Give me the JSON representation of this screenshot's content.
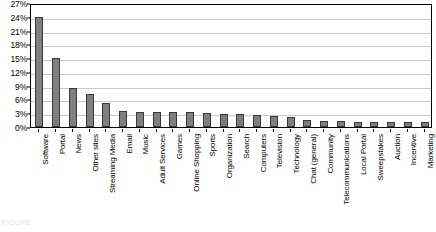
{
  "chart_data": {
    "type": "bar",
    "title": "",
    "xlabel": "",
    "ylabel": "",
    "ylim": [
      0,
      27
    ],
    "ytick_step": 3,
    "grid": true,
    "legend": null,
    "bar_color": "#7f7f7f",
    "bar_border_color": "#3a3a3a",
    "gridline_color": "#c9c9c9",
    "axis_color": "#000000",
    "ytick_labels": [
      "0%",
      "3%",
      "6%",
      "9%",
      "12%",
      "15%",
      "18%",
      "21%",
      "24%",
      "27%"
    ],
    "ytick_values": [
      0,
      3,
      6,
      9,
      12,
      15,
      18,
      21,
      24,
      27
    ],
    "categories": [
      "Software",
      "Portal",
      "News",
      "Other sites",
      "Streaming Media",
      "Email",
      "Music",
      "Adult Services",
      "Games",
      "Online Shopping",
      "Sports",
      "Organization",
      "Search",
      "Computers",
      "Television",
      "Technology",
      "Chat (general)",
      "Community",
      "Telecommunications",
      "Local Portal",
      "Sweepstakes",
      "Auction",
      "Incentive",
      "Marketing"
    ],
    "values": [
      24.0,
      15.0,
      8.4,
      7.2,
      5.2,
      3.4,
      3.3,
      3.3,
      3.2,
      3.2,
      3.1,
      2.9,
      2.8,
      2.6,
      2.4,
      2.1,
      1.5,
      1.3,
      1.3,
      1.2,
      1.2,
      1.2,
      1.1,
      1.1
    ]
  },
  "caption": {
    "text": "FIGURE"
  }
}
